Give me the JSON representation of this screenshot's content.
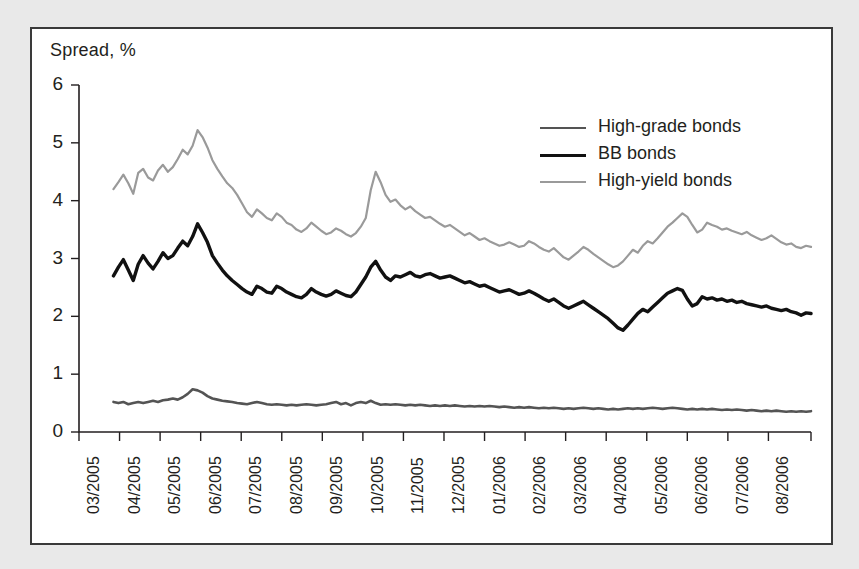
{
  "figure": {
    "axis_title": "Spread, %",
    "background": "#e9e9e9",
    "panel_background": "#ffffff",
    "frame_color": "#3a3a3a"
  },
  "legend": {
    "position": "top-right",
    "items": [
      {
        "label": "High-grade bonds",
        "color": "#545454",
        "width": 2.6
      },
      {
        "label": "BB bonds",
        "color": "#111111",
        "width": 3.4
      },
      {
        "label": "High-yield bonds",
        "color": "#9a9a9a",
        "width": 2.2
      }
    ]
  },
  "chart_data": {
    "type": "line",
    "title": "",
    "subtitle": "",
    "xlabel": "",
    "ylabel": "Spread, %",
    "ylim": [
      0,
      6
    ],
    "yticks": [
      0,
      1,
      2,
      3,
      4,
      5,
      6
    ],
    "ytick_labels": [
      "0",
      "1",
      "2",
      "3",
      "4",
      "5",
      "6"
    ],
    "grid": false,
    "legend_position": "top-right",
    "x_tick_labels": [
      "03/2005",
      "04/2005",
      "05/2005",
      "06/2005",
      "07/2005",
      "08/2005",
      "09/2005",
      "10/2005",
      "11/2005",
      "12/2005",
      "01/2006",
      "02/2006",
      "03/2006",
      "04/2006",
      "05/2006",
      "06/2006",
      "07/2006",
      "08/2006"
    ],
    "x_range": [
      "03/2005",
      "09/2006"
    ],
    "x_note": "weekly/daily observations; data begins late 03/2005 and ends mid 09/2006",
    "series": [
      {
        "name": "High-yield bonds",
        "color": "#9a9a9a",
        "values": [
          4.2,
          4.32,
          4.45,
          4.3,
          4.12,
          4.48,
          4.55,
          4.4,
          4.35,
          4.52,
          4.62,
          4.5,
          4.58,
          4.72,
          4.88,
          4.8,
          4.95,
          5.22,
          5.1,
          4.92,
          4.7,
          4.55,
          4.42,
          4.3,
          4.22,
          4.1,
          3.95,
          3.8,
          3.72,
          3.85,
          3.78,
          3.7,
          3.66,
          3.78,
          3.72,
          3.62,
          3.58,
          3.5,
          3.46,
          3.52,
          3.62,
          3.55,
          3.48,
          3.42,
          3.45,
          3.52,
          3.48,
          3.42,
          3.38,
          3.44,
          3.55,
          3.7,
          4.18,
          4.5,
          4.32,
          4.1,
          3.98,
          4.02,
          3.92,
          3.85,
          3.9,
          3.82,
          3.76,
          3.7,
          3.72,
          3.66,
          3.6,
          3.55,
          3.58,
          3.52,
          3.46,
          3.4,
          3.44,
          3.38,
          3.32,
          3.35,
          3.3,
          3.26,
          3.22,
          3.24,
          3.28,
          3.24,
          3.2,
          3.22,
          3.3,
          3.26,
          3.2,
          3.15,
          3.12,
          3.18,
          3.1,
          3.02,
          2.98,
          3.05,
          3.12,
          3.2,
          3.15,
          3.08,
          3.02,
          2.96,
          2.9,
          2.85,
          2.88,
          2.95,
          3.05,
          3.15,
          3.1,
          3.22,
          3.3,
          3.26,
          3.35,
          3.45,
          3.55,
          3.62,
          3.7,
          3.78,
          3.72,
          3.58,
          3.45,
          3.5,
          3.62,
          3.58,
          3.55,
          3.5,
          3.52,
          3.48,
          3.45,
          3.42,
          3.46,
          3.4,
          3.36,
          3.32,
          3.35,
          3.4,
          3.34,
          3.28,
          3.24,
          3.26,
          3.2,
          3.18,
          3.22,
          3.2
        ]
      },
      {
        "name": "BB bonds",
        "color": "#111111",
        "values": [
          2.7,
          2.85,
          2.98,
          2.8,
          2.62,
          2.9,
          3.05,
          2.92,
          2.82,
          2.95,
          3.1,
          3.0,
          3.05,
          3.18,
          3.3,
          3.22,
          3.38,
          3.6,
          3.45,
          3.28,
          3.05,
          2.92,
          2.8,
          2.7,
          2.62,
          2.55,
          2.48,
          2.42,
          2.38,
          2.52,
          2.48,
          2.42,
          2.4,
          2.52,
          2.48,
          2.42,
          2.38,
          2.34,
          2.32,
          2.38,
          2.48,
          2.42,
          2.38,
          2.35,
          2.38,
          2.44,
          2.4,
          2.36,
          2.34,
          2.42,
          2.55,
          2.68,
          2.85,
          2.95,
          2.8,
          2.68,
          2.62,
          2.7,
          2.68,
          2.72,
          2.76,
          2.7,
          2.68,
          2.72,
          2.74,
          2.7,
          2.66,
          2.68,
          2.7,
          2.66,
          2.62,
          2.58,
          2.6,
          2.56,
          2.52,
          2.54,
          2.5,
          2.46,
          2.42,
          2.44,
          2.46,
          2.42,
          2.38,
          2.4,
          2.44,
          2.4,
          2.35,
          2.3,
          2.26,
          2.3,
          2.24,
          2.18,
          2.14,
          2.18,
          2.22,
          2.26,
          2.2,
          2.14,
          2.08,
          2.02,
          1.96,
          1.88,
          1.8,
          1.76,
          1.85,
          1.95,
          2.05,
          2.12,
          2.08,
          2.16,
          2.24,
          2.32,
          2.4,
          2.44,
          2.48,
          2.45,
          2.3,
          2.18,
          2.22,
          2.34,
          2.3,
          2.32,
          2.28,
          2.3,
          2.26,
          2.28,
          2.24,
          2.26,
          2.22,
          2.2,
          2.18,
          2.16,
          2.18,
          2.14,
          2.12,
          2.1,
          2.12,
          2.08,
          2.06,
          2.02,
          2.06,
          2.05
        ]
      },
      {
        "name": "High-grade bonds",
        "color": "#545454",
        "values": [
          0.52,
          0.5,
          0.52,
          0.48,
          0.5,
          0.52,
          0.5,
          0.52,
          0.54,
          0.52,
          0.55,
          0.56,
          0.58,
          0.56,
          0.6,
          0.66,
          0.74,
          0.72,
          0.68,
          0.62,
          0.58,
          0.56,
          0.54,
          0.53,
          0.52,
          0.5,
          0.49,
          0.48,
          0.5,
          0.52,
          0.5,
          0.48,
          0.47,
          0.48,
          0.47,
          0.46,
          0.47,
          0.46,
          0.47,
          0.48,
          0.47,
          0.46,
          0.47,
          0.48,
          0.5,
          0.52,
          0.48,
          0.5,
          0.46,
          0.5,
          0.52,
          0.5,
          0.54,
          0.5,
          0.47,
          0.48,
          0.47,
          0.48,
          0.47,
          0.46,
          0.47,
          0.46,
          0.47,
          0.46,
          0.45,
          0.46,
          0.45,
          0.46,
          0.45,
          0.46,
          0.45,
          0.44,
          0.45,
          0.44,
          0.45,
          0.44,
          0.45,
          0.44,
          0.43,
          0.44,
          0.43,
          0.42,
          0.43,
          0.42,
          0.43,
          0.42,
          0.41,
          0.42,
          0.41,
          0.42,
          0.41,
          0.4,
          0.41,
          0.4,
          0.41,
          0.42,
          0.41,
          0.4,
          0.41,
          0.4,
          0.39,
          0.4,
          0.39,
          0.4,
          0.41,
          0.4,
          0.41,
          0.4,
          0.41,
          0.42,
          0.41,
          0.4,
          0.41,
          0.42,
          0.41,
          0.4,
          0.39,
          0.4,
          0.39,
          0.4,
          0.39,
          0.4,
          0.39,
          0.38,
          0.39,
          0.38,
          0.39,
          0.38,
          0.37,
          0.38,
          0.37,
          0.36,
          0.37,
          0.36,
          0.37,
          0.36,
          0.35,
          0.36,
          0.35,
          0.36,
          0.35,
          0.36
        ]
      }
    ]
  }
}
